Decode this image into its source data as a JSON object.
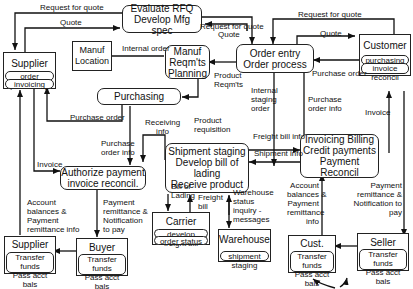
{
  "processes": {
    "evaluate_rfq": [
      "Evaluate RFQ",
      "Develop Mfg spec"
    ],
    "order_entry": [
      "Order entry",
      "Order process"
    ],
    "manuf_reqmts": [
      "Manuf",
      "Reqm'ts",
      "Planning"
    ],
    "purchasing": [
      "Purchasing"
    ],
    "shipment_staging": [
      "Shipment staging",
      "Develop bill of lading",
      "Receive product"
    ],
    "invoicing": [
      "Invoicing Billing",
      "Credit payments",
      "Payment Reconcil"
    ],
    "authorize_payment": [
      "Authorize payment",
      "invoice reconcil."
    ]
  },
  "entities": {
    "supplier": {
      "title": "Supplier",
      "subs": [
        "order processing",
        "invoicing"
      ]
    },
    "customer": {
      "title": "Customer",
      "subs": [
        "purchasing",
        "invoice reconcil"
      ]
    },
    "manuf_location": {
      "title": [
        "Manuf",
        "Location"
      ]
    },
    "carrier": {
      "title": "Carrier",
      "subs": [
        "develop freight bill",
        "order status"
      ]
    },
    "warehouse": {
      "title": "Warehouse",
      "subs": [
        "shipment staging"
      ]
    },
    "supplier_bank": {
      "title": "Supplier bank",
      "subs": [
        "Transfer funds",
        "Pass acct  bals"
      ]
    },
    "buyer_bank": {
      "title": "Buyer bank",
      "subs": [
        "Transfer funds",
        "Pass acct  bals"
      ]
    },
    "cust_bank": {
      "title": "Cust. bank",
      "subs": [
        "Transfer funds",
        "Pass acct  bals"
      ]
    },
    "seller_bank": {
      "title": "Seller bank",
      "subs": [
        "Transfer funds",
        "Pass acct  bals"
      ]
    }
  },
  "flows": {
    "rfq_supplier": "Request for quote",
    "quote_supplier": "Quote",
    "rfq_mid": "Request for quote",
    "quote_mid": "Quote",
    "rfq_customer": "Request for quote",
    "quote_customer": "Quote",
    "internal_order": "Internal order",
    "product_reqmts": [
      "Product",
      "Reqm'ts"
    ],
    "purchase_order_customer": "Purchase order",
    "purchase_order_supplier": "Purchase order",
    "purchase_order_info_left": [
      "Purchase",
      "order info"
    ],
    "purchase_order_info_right": [
      "Purchase",
      "order info"
    ],
    "internal_staging_order": [
      "Internal",
      "staging",
      "order"
    ],
    "receiving_info": [
      "Receiving",
      "info"
    ],
    "product_requisition": [
      "Product",
      "requisition"
    ],
    "invoice_supplier": "Invoice",
    "invoice_customer": "Invoice",
    "freight_bill_info": "Freight bill info",
    "shipment_info": "Shipment info",
    "bill_of_lading": [
      "Bill of",
      "Lading"
    ],
    "freight_bill": [
      "Freight",
      "bill"
    ],
    "warehouse_status": [
      "Warehouse",
      "status",
      "inquiry -",
      "messages"
    ],
    "account_balances_left": [
      "Account",
      "balances &",
      "Payment",
      "remittance info"
    ],
    "payment_remittance_left": [
      "Payment",
      "remittance &",
      "Notification",
      "to pay"
    ],
    "account_balances_right": [
      "Account",
      "balances &",
      "Payment",
      "remittance",
      "info"
    ],
    "payment_remittance_right": [
      "Payment",
      "remittance &",
      "Notification to",
      "pay"
    ]
  }
}
